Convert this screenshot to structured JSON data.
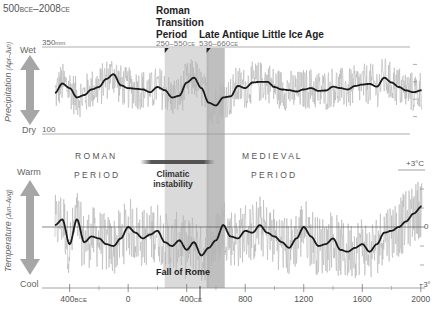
{
  "chart_data": [
    {
      "type": "line",
      "name": "precipitation",
      "title": "500BCE–2008CE",
      "title_parts": {
        "start": "500",
        "start_era": "BCE",
        "sep": "–",
        "end": "2008",
        "end_era": "CE"
      },
      "ylabel": "Precipitation (Apr–Jun)",
      "ylabel_parts": {
        "main": "Precipitation",
        "sub": "(Apr–Jun)"
      },
      "y_top_label": "Wet",
      "y_bottom_label": "Dry",
      "y_max_label": "350mm",
      "y_max_value": "350",
      "y_max_unit": "mm",
      "y_min_label": "100",
      "ylim": [
        100,
        350
      ],
      "xlim": [
        -500,
        2008
      ],
      "smoothed_series": {
        "name": "Precipitation (smoothed)",
        "x": [
          -500,
          -450,
          -400,
          -350,
          -300,
          -250,
          -200,
          -150,
          -100,
          -50,
          0,
          50,
          100,
          150,
          200,
          250,
          300,
          350,
          400,
          450,
          500,
          550,
          600,
          650,
          700,
          750,
          800,
          850,
          900,
          950,
          1000,
          1050,
          1100,
          1150,
          1200,
          1250,
          1300,
          1350,
          1400,
          1450,
          1500,
          1550,
          1600,
          1650,
          1700,
          1750,
          1800,
          1850,
          1900,
          1950,
          2008
        ],
        "y": [
          218,
          245,
          232,
          205,
          212,
          228,
          235,
          258,
          272,
          240,
          232,
          230,
          228,
          220,
          235,
          226,
          205,
          210,
          248,
          262,
          232,
          190,
          182,
          205,
          208,
          238,
          232,
          248,
          250,
          250,
          235,
          228,
          226,
          222,
          228,
          232,
          224,
          225,
          236,
          232,
          228,
          238,
          242,
          244,
          236,
          262,
          248,
          235,
          225,
          220,
          226
        ]
      }
    },
    {
      "type": "line",
      "name": "temperature",
      "ylabel": "Temperature (Jun–Aug)",
      "ylabel_parts": {
        "main": "Temperature",
        "sub": "(Jun–Aug)"
      },
      "y_top_label": "Warm",
      "y_bottom_label": "Cool",
      "y_max_label": "+3°C",
      "y_zero_label": "0",
      "y_min_label": "−3°",
      "ylim": [
        -3,
        3
      ],
      "xlim": [
        -500,
        2008
      ],
      "smoothed_series": {
        "name": "Temperature anomaly (smoothed)",
        "x": [
          -500,
          -450,
          -400,
          -350,
          -300,
          -250,
          -200,
          -150,
          -100,
          -50,
          0,
          50,
          100,
          150,
          200,
          250,
          300,
          350,
          400,
          450,
          500,
          550,
          600,
          650,
          700,
          750,
          800,
          850,
          900,
          950,
          1000,
          1050,
          1100,
          1150,
          1200,
          1250,
          1300,
          1350,
          1400,
          1450,
          1500,
          1550,
          1600,
          1650,
          1700,
          1750,
          1800,
          1850,
          1900,
          1950,
          2008
        ],
        "y": [
          0.1,
          0.4,
          -0.9,
          0.4,
          -0.8,
          -0.5,
          -0.6,
          -0.9,
          -1.0,
          -0.6,
          0.0,
          -0.3,
          -0.6,
          -0.4,
          -0.2,
          -0.8,
          -1.0,
          -0.7,
          -1.2,
          -0.8,
          -1.5,
          -1.1,
          -0.7,
          0.1,
          -0.5,
          -0.6,
          -0.2,
          -0.3,
          0.1,
          -0.3,
          -0.5,
          -0.8,
          -1.1,
          -0.6,
          0.0,
          -0.5,
          -1.0,
          -0.9,
          -0.6,
          -1.2,
          -1.3,
          -1.1,
          -0.9,
          -1.3,
          -0.9,
          -0.3,
          -0.2,
          0.0,
          0.3,
          0.7,
          1.1
        ]
      }
    }
  ],
  "xaxis": {
    "ticks": [
      -400,
      0,
      400,
      800,
      1200,
      1600,
      2000
    ],
    "tick_labels": [
      {
        "value": "400",
        "era": "BCE"
      },
      {
        "value": "0",
        "era": ""
      },
      {
        "value": "400",
        "era": "CE"
      },
      {
        "value": "800",
        "era": ""
      },
      {
        "value": "1200",
        "era": ""
      },
      {
        "value": "1600",
        "era": ""
      },
      {
        "value": "2000",
        "era": ""
      }
    ],
    "minor_ticks": [
      -200,
      200,
      600,
      1000,
      1400,
      1800
    ]
  },
  "periods": [
    {
      "name": "Roman Transition Period",
      "lines": [
        "Roman",
        "Transition",
        "Period"
      ],
      "range_label": "250–550",
      "range_era": "CE",
      "start": 250,
      "end": 550,
      "color": "#d3d3d3"
    },
    {
      "name": "Late Antique Little Ice Age",
      "lines": [
        "Late Antique Little Ice Age"
      ],
      "range_label": "536–660",
      "range_era": "CE",
      "start": 536,
      "end": 660,
      "color": "#a9a9a9"
    }
  ],
  "annotations": {
    "roman_period": [
      "R O M A N",
      "P E R I O D"
    ],
    "medieval_period": [
      "M E D I E V A L",
      "P E R I O D"
    ],
    "climatic_instability": [
      "Climatic",
      "instability"
    ],
    "fall_of_rome": "Fall of Rome",
    "fall_of_rome_year": 476
  },
  "colors": {
    "raw_series": "#b5b5b5",
    "smoothed_series": "#1a1a1a",
    "arrow": "#a6a6a6",
    "axis": "#8a8a8a",
    "text": "#444444",
    "label_text": "#666666"
  }
}
